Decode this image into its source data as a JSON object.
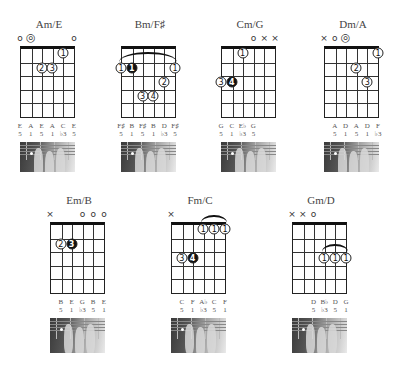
{
  "chords": [
    {
      "name": "Am/E",
      "open_markers": [
        "o",
        "◎",
        "",
        "",
        "",
        "o"
      ],
      "notes": [
        "E",
        "A",
        "E",
        "A",
        "C",
        "E"
      ],
      "degrees": [
        "5",
        "1",
        "5",
        "1",
        "♭3",
        "5"
      ],
      "fingers": [
        {
          "string": 5,
          "fret": 1,
          "label": "1",
          "filled": false
        },
        {
          "string": 3,
          "fret": 2,
          "label": "2",
          "filled": false
        },
        {
          "string": 4,
          "fret": 2,
          "label": "3",
          "filled": false
        }
      ]
    },
    {
      "name": "Bm/F♯",
      "open_markers": [
        "",
        "",
        "",
        "",
        "",
        ""
      ],
      "barre": {
        "from": 1,
        "to": 6,
        "fret": 1
      },
      "notes": [
        "F♯",
        "B",
        "F♯",
        "B",
        "D",
        "F♯"
      ],
      "degrees": [
        "5",
        "1",
        "5",
        "1",
        "♭3",
        "5"
      ],
      "fingers": [
        {
          "string": 1,
          "fret": 2,
          "label": "1",
          "filled": false
        },
        {
          "string": 2,
          "fret": 2,
          "label": "1",
          "filled": true
        },
        {
          "string": 6,
          "fret": 2,
          "label": "1",
          "filled": false
        },
        {
          "string": 5,
          "fret": 3,
          "label": "2",
          "filled": false
        },
        {
          "string": 3,
          "fret": 4,
          "label": "3",
          "filled": false
        },
        {
          "string": 4,
          "fret": 4,
          "label": "4",
          "filled": false
        }
      ]
    },
    {
      "name": "Cm/G",
      "open_markers": [
        "",
        "",
        "",
        "o",
        "×",
        "×"
      ],
      "notes": [
        "G",
        "C",
        "E♭",
        "G",
        "",
        ""
      ],
      "degrees": [
        "5",
        "1",
        "♭3",
        "5",
        "",
        ""
      ],
      "fingers": [
        {
          "string": 3,
          "fret": 1,
          "label": "1",
          "filled": false
        },
        {
          "string": 1,
          "fret": 3,
          "label": "3",
          "filled": false
        },
        {
          "string": 2,
          "fret": 3,
          "label": "4",
          "filled": true
        }
      ]
    },
    {
      "name": "Dm/A",
      "open_markers": [
        "×",
        "o",
        "◎",
        "",
        "",
        ""
      ],
      "notes": [
        "",
        "A",
        "D",
        "A",
        "D",
        "F"
      ],
      "degrees": [
        "",
        "5",
        "1",
        "5",
        "1",
        "♭3"
      ],
      "fingers": [
        {
          "string": 6,
          "fret": 1,
          "label": "1",
          "filled": false
        },
        {
          "string": 4,
          "fret": 2,
          "label": "2",
          "filled": false
        },
        {
          "string": 5,
          "fret": 3,
          "label": "3",
          "filled": false
        }
      ]
    },
    {
      "name": "Em/B",
      "open_markers": [
        "×",
        "",
        "",
        "o",
        "o",
        "o"
      ],
      "notes": [
        "",
        "B",
        "E",
        "G",
        "B",
        "E"
      ],
      "degrees": [
        "",
        "5",
        "1",
        "♭3",
        "5",
        "1"
      ],
      "fingers": [
        {
          "string": 2,
          "fret": 2,
          "label": "2",
          "filled": false
        },
        {
          "string": 3,
          "fret": 2,
          "label": "3",
          "filled": true
        }
      ]
    },
    {
      "name": "Fm/C",
      "open_markers": [
        "×",
        "",
        "",
        "",
        "",
        ""
      ],
      "barre": {
        "from": 4,
        "to": 6,
        "fret": 1
      },
      "notes": [
        "",
        "C",
        "F",
        "A♭",
        "C",
        "F"
      ],
      "degrees": [
        "",
        "5",
        "1",
        "♭3",
        "5",
        "1"
      ],
      "fingers": [
        {
          "string": 4,
          "fret": 1,
          "label": "1",
          "filled": false
        },
        {
          "string": 5,
          "fret": 1,
          "label": "1",
          "filled": false
        },
        {
          "string": 6,
          "fret": 1,
          "label": "1",
          "filled": false
        },
        {
          "string": 2,
          "fret": 3,
          "label": "3",
          "filled": false
        },
        {
          "string": 3,
          "fret": 3,
          "label": "4",
          "filled": true
        }
      ]
    },
    {
      "name": "Gm/D",
      "open_markers": [
        "×",
        "×",
        "o",
        "",
        "",
        ""
      ],
      "barre": {
        "from": 4,
        "to": 6,
        "fret": 3
      },
      "notes": [
        "",
        "",
        "D",
        "B♭",
        "D",
        "G"
      ],
      "degrees": [
        "",
        "",
        "5",
        "♭3",
        "5",
        "1"
      ],
      "fingers": [
        {
          "string": 4,
          "fret": 3,
          "label": "1",
          "filled": false
        },
        {
          "string": 5,
          "fret": 3,
          "label": "1",
          "filled": false
        },
        {
          "string": 6,
          "fret": 3,
          "label": "1",
          "filled": false
        }
      ]
    }
  ]
}
